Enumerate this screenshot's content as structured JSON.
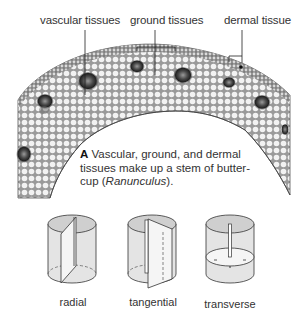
{
  "figure": {
    "labels": {
      "vascular": "vascular tissues",
      "ground": "ground tissues",
      "dermal": "dermal tissue"
    },
    "caption": {
      "letter": "A",
      "line1_rest": " Vascular, ground, and dermal",
      "line2": "tissues make up a stem of butter-",
      "line3_pre": "cup (",
      "line3_italic": "Ranunculus",
      "line3_post": ")."
    },
    "sections": [
      {
        "label": "radial"
      },
      {
        "label": "tangential"
      },
      {
        "label": "transverse"
      }
    ],
    "colors": {
      "tissue_dark": "#3a3a3a",
      "tissue_mid": "#8a8a8a",
      "tissue_light": "#e6e6e6",
      "cylinder_fill": "#e2e2e2",
      "cylinder_top": "#cfcfcf",
      "line": "#333333"
    }
  }
}
